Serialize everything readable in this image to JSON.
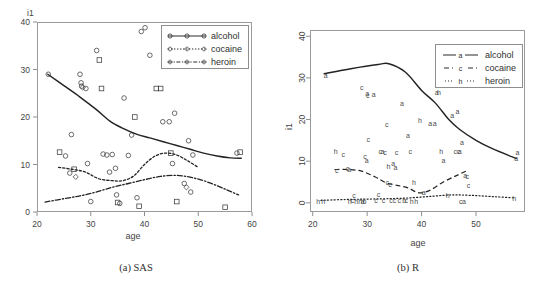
{
  "figure": {
    "panels": [
      {
        "id": "sas",
        "caption": "(a) SAS",
        "ylabel": "i1",
        "xlabel": "age"
      },
      {
        "id": "r",
        "caption": "(b) R",
        "ylabel": "i1",
        "xlabel": "age"
      }
    ]
  },
  "legend": {
    "alcohol": "alcohol",
    "cocaine": "cocaine",
    "heroin": "heroin"
  },
  "ticks": {
    "sas_y": [
      "40",
      "30",
      "20",
      "10",
      "0"
    ],
    "sas_x": [
      "20",
      "30",
      "40",
      "50",
      "60"
    ],
    "r_y": [
      "40",
      "30",
      "20",
      "10",
      "0"
    ],
    "r_x": [
      "20",
      "30",
      "40",
      "50"
    ]
  },
  "chart_data": [
    {
      "type": "scatter",
      "panel": "(a) SAS",
      "title": "",
      "xlabel": "age",
      "ylabel": "i1",
      "xlim": [
        20,
        60
      ],
      "ylim": [
        0,
        40
      ],
      "grid": false,
      "legend_position": "top-right",
      "legend_entries": [
        "alcohol",
        "cocaine",
        "heroin"
      ],
      "marker_styles": [
        "open-circle",
        "open-square",
        "open-diamond"
      ],
      "series": [
        {
          "name": "alcohol",
          "line_style": "solid",
          "x": [
            22.0,
            25.0,
            28.0,
            31.0,
            33.5,
            36.0,
            38.5,
            41.0,
            43.5,
            46.0,
            48.5,
            51.0,
            53.5,
            56.0,
            58.0
          ],
          "values": [
            29.0,
            26.6,
            24.2,
            21.6,
            19.2,
            17.6,
            16.4,
            15.6,
            14.8,
            14.0,
            13.2,
            12.4,
            11.8,
            11.4,
            11.3
          ]
        },
        {
          "name": "cocaine",
          "line_style": "dotted",
          "x": [
            24.0,
            26.5,
            29.0,
            31.5,
            34.0,
            36.0,
            38.0,
            40.0,
            42.0,
            44.0,
            46.0,
            48.0,
            50.0
          ],
          "values": [
            9.4,
            9.0,
            8.4,
            7.0,
            6.6,
            6.6,
            7.6,
            10.0,
            11.8,
            12.4,
            12.0,
            10.8,
            9.4
          ]
        },
        {
          "name": "heroin",
          "line_style": "dash-dot",
          "x": [
            21.5,
            25.0,
            28.0,
            31.0,
            34.0,
            37.0,
            40.0,
            43.0,
            46.0,
            49.0,
            52.0,
            55.0,
            57.5
          ],
          "values": [
            2.1,
            2.8,
            3.4,
            4.2,
            5.2,
            6.0,
            6.8,
            7.5,
            7.7,
            7.2,
            6.2,
            4.8,
            3.6
          ]
        }
      ],
      "points": [
        {
          "x": 22.1,
          "y": 29.0,
          "m": "circle"
        },
        {
          "x": 24.2,
          "y": 12.6,
          "m": "square"
        },
        {
          "x": 25.3,
          "y": 11.8,
          "m": "circle"
        },
        {
          "x": 26.1,
          "y": 8.2,
          "m": "circle"
        },
        {
          "x": 26.4,
          "y": 16.3,
          "m": "circle"
        },
        {
          "x": 26.9,
          "y": 9.0,
          "m": "square"
        },
        {
          "x": 27.2,
          "y": 7.4,
          "m": "diamond"
        },
        {
          "x": 28.0,
          "y": 29.0,
          "m": "circle"
        },
        {
          "x": 28.2,
          "y": 27.2,
          "m": "circle"
        },
        {
          "x": 28.3,
          "y": 26.5,
          "m": "circle"
        },
        {
          "x": 28.5,
          "y": 26.2,
          "m": "diamond"
        },
        {
          "x": 29.1,
          "y": 26.0,
          "m": "circle"
        },
        {
          "x": 29.4,
          "y": 10.2,
          "m": "circle"
        },
        {
          "x": 30.0,
          "y": 2.2,
          "m": "circle"
        },
        {
          "x": 31.1,
          "y": 34.0,
          "m": "circle"
        },
        {
          "x": 31.6,
          "y": 32.0,
          "m": "square"
        },
        {
          "x": 32.0,
          "y": 26.0,
          "m": "square"
        },
        {
          "x": 32.3,
          "y": 12.2,
          "m": "circle"
        },
        {
          "x": 33.0,
          "y": 12.0,
          "m": "circle"
        },
        {
          "x": 33.5,
          "y": 8.4,
          "m": "circle"
        },
        {
          "x": 34.0,
          "y": 12.1,
          "m": "circle"
        },
        {
          "x": 34.6,
          "y": 9.2,
          "m": "circle"
        },
        {
          "x": 34.8,
          "y": 3.6,
          "m": "circle"
        },
        {
          "x": 35.0,
          "y": 2.0,
          "m": "square"
        },
        {
          "x": 35.4,
          "y": 1.8,
          "m": "circle"
        },
        {
          "x": 36.2,
          "y": 24.0,
          "m": "circle"
        },
        {
          "x": 37.0,
          "y": 11.9,
          "m": "circle"
        },
        {
          "x": 37.6,
          "y": 16.2,
          "m": "circle"
        },
        {
          "x": 38.2,
          "y": 20.0,
          "m": "square"
        },
        {
          "x": 38.6,
          "y": 3.0,
          "m": "circle"
        },
        {
          "x": 39.0,
          "y": 1.2,
          "m": "square"
        },
        {
          "x": 39.4,
          "y": 38.0,
          "m": "circle"
        },
        {
          "x": 40.1,
          "y": 38.8,
          "m": "circle"
        },
        {
          "x": 41.0,
          "y": 33.0,
          "m": "circle"
        },
        {
          "x": 42.2,
          "y": 26.0,
          "m": "square"
        },
        {
          "x": 43.0,
          "y": 26.0,
          "m": "square"
        },
        {
          "x": 43.4,
          "y": 19.0,
          "m": "circle"
        },
        {
          "x": 44.6,
          "y": 19.0,
          "m": "circle"
        },
        {
          "x": 44.9,
          "y": 12.4,
          "m": "square"
        },
        {
          "x": 45.2,
          "y": 10.2,
          "m": "circle"
        },
        {
          "x": 45.6,
          "y": 20.8,
          "m": "circle"
        },
        {
          "x": 46.0,
          "y": 2.2,
          "m": "square"
        },
        {
          "x": 47.4,
          "y": 6.0,
          "m": "circle"
        },
        {
          "x": 47.8,
          "y": 5.2,
          "m": "diamond"
        },
        {
          "x": 48.2,
          "y": 15.0,
          "m": "circle"
        },
        {
          "x": 48.6,
          "y": 4.2,
          "m": "circle"
        },
        {
          "x": 49.0,
          "y": 12.0,
          "m": "circle"
        },
        {
          "x": 55.0,
          "y": 1.0,
          "m": "square"
        },
        {
          "x": 57.2,
          "y": 12.4,
          "m": "circle"
        },
        {
          "x": 57.8,
          "y": 12.6,
          "m": "square"
        }
      ]
    },
    {
      "type": "scatter",
      "panel": "(b) R",
      "title": "",
      "xlabel": "age",
      "ylabel": "i1",
      "xlim": [
        20,
        58
      ],
      "ylim": [
        0,
        40
      ],
      "grid": false,
      "legend_position": "top-right",
      "legend_entries": [
        "alcohol",
        "cocaine",
        "heroin"
      ],
      "marker_styles": [
        "a",
        "c",
        "h"
      ],
      "series": [
        {
          "name": "alcohol",
          "line_style": "solid",
          "x": [
            22.0,
            27.0,
            32.0,
            34.0,
            37.0,
            40.0,
            42.5,
            45.0,
            47.0,
            50.0,
            53.0,
            57.5
          ],
          "values": [
            31.0,
            32.2,
            33.2,
            33.4,
            31.4,
            27.0,
            24.0,
            20.0,
            17.6,
            15.0,
            13.0,
            10.6
          ]
        },
        {
          "name": "cocaine",
          "line_style": "dashed",
          "x": [
            24.0,
            26.5,
            29.0,
            31.5,
            33.5,
            35.5,
            37.5,
            39.5,
            41.5,
            44.0,
            46.5,
            48.5
          ],
          "values": [
            8.0,
            8.0,
            7.6,
            6.2,
            4.8,
            4.2,
            3.6,
            2.4,
            3.0,
            5.0,
            6.6,
            7.8
          ]
        },
        {
          "name": "heroin",
          "line_style": "dotted",
          "x": [
            21.5,
            26.0,
            30.0,
            34.0,
            38.0,
            42.0,
            45.5,
            49.0,
            53.0,
            57.0
          ],
          "values": [
            0.6,
            0.8,
            0.9,
            1.0,
            1.2,
            1.6,
            1.9,
            1.8,
            1.5,
            1.2
          ]
        }
      ],
      "points": [
        {
          "x": 22.4,
          "y": 30.6,
          "m": "a"
        },
        {
          "x": 21.0,
          "y": 0.4,
          "m": "h"
        },
        {
          "x": 21.9,
          "y": 0.4,
          "m": "h"
        },
        {
          "x": 24.2,
          "y": 12.4,
          "m": "h"
        },
        {
          "x": 24.4,
          "y": 8.0,
          "m": "c"
        },
        {
          "x": 25.6,
          "y": 11.8,
          "m": "c"
        },
        {
          "x": 26.4,
          "y": 8.3,
          "m": "c"
        },
        {
          "x": 26.7,
          "y": 8.1,
          "m": "a"
        },
        {
          "x": 26.8,
          "y": 0.5,
          "m": "h"
        },
        {
          "x": 27.3,
          "y": 0.6,
          "m": "c"
        },
        {
          "x": 27.6,
          "y": 2.0,
          "m": "c"
        },
        {
          "x": 28.0,
          "y": 0.5,
          "m": "h"
        },
        {
          "x": 28.7,
          "y": 0.5,
          "m": "h"
        },
        {
          "x": 29.0,
          "y": 27.8,
          "m": "c"
        },
        {
          "x": 29.2,
          "y": 0.5,
          "m": "a"
        },
        {
          "x": 29.5,
          "y": 0.5,
          "m": "b"
        },
        {
          "x": 29.6,
          "y": 11.2,
          "m": "c"
        },
        {
          "x": 29.9,
          "y": 10.4,
          "m": "a"
        },
        {
          "x": 30.0,
          "y": 26.4,
          "m": "a"
        },
        {
          "x": 30.1,
          "y": 26.0,
          "m": "c"
        },
        {
          "x": 30.2,
          "y": 15.4,
          "m": "c"
        },
        {
          "x": 31.2,
          "y": 26.2,
          "m": "a"
        },
        {
          "x": 31.6,
          "y": 0.6,
          "m": "c"
        },
        {
          "x": 32.1,
          "y": 2.2,
          "m": "c"
        },
        {
          "x": 32.4,
          "y": 12.4,
          "m": "c"
        },
        {
          "x": 32.8,
          "y": 12.4,
          "m": "a"
        },
        {
          "x": 33.0,
          "y": 0.6,
          "m": "c"
        },
        {
          "x": 33.3,
          "y": 12.3,
          "m": "c"
        },
        {
          "x": 33.6,
          "y": 19.0,
          "m": "c"
        },
        {
          "x": 33.7,
          "y": 5.0,
          "m": "c"
        },
        {
          "x": 33.9,
          "y": 8.8,
          "m": "h"
        },
        {
          "x": 34.2,
          "y": 4.6,
          "m": "c"
        },
        {
          "x": 34.4,
          "y": 0.6,
          "m": "c"
        },
        {
          "x": 34.8,
          "y": 9.6,
          "m": "a"
        },
        {
          "x": 35.0,
          "y": 0.6,
          "m": "c"
        },
        {
          "x": 35.2,
          "y": 8.6,
          "m": "a"
        },
        {
          "x": 35.4,
          "y": 12.3,
          "m": "c"
        },
        {
          "x": 35.9,
          "y": 0.6,
          "m": "c"
        },
        {
          "x": 36.4,
          "y": 24.0,
          "m": "a"
        },
        {
          "x": 36.8,
          "y": 0.6,
          "m": "b"
        },
        {
          "x": 37.2,
          "y": 0.6,
          "m": "c"
        },
        {
          "x": 37.5,
          "y": 16.4,
          "m": "a"
        },
        {
          "x": 37.9,
          "y": 12.4,
          "m": "c"
        },
        {
          "x": 38.2,
          "y": 0.5,
          "m": "h"
        },
        {
          "x": 38.6,
          "y": 5.0,
          "m": "h"
        },
        {
          "x": 39.0,
          "y": 0.5,
          "m": "h"
        },
        {
          "x": 39.7,
          "y": 20.0,
          "m": "h"
        },
        {
          "x": 40.4,
          "y": 2.6,
          "m": "a"
        },
        {
          "x": 41.6,
          "y": 19.2,
          "m": "a"
        },
        {
          "x": 42.4,
          "y": 19.2,
          "m": "a"
        },
        {
          "x": 42.8,
          "y": 26.6,
          "m": "a"
        },
        {
          "x": 43.2,
          "y": 26.6,
          "m": "h"
        },
        {
          "x": 43.6,
          "y": 12.4,
          "m": "h"
        },
        {
          "x": 44.0,
          "y": 10.2,
          "m": "a"
        },
        {
          "x": 44.8,
          "y": 1.8,
          "m": "h"
        },
        {
          "x": 45.6,
          "y": 21.0,
          "m": "a"
        },
        {
          "x": 46.2,
          "y": 12.4,
          "m": "c"
        },
        {
          "x": 46.8,
          "y": 12.4,
          "m": "c"
        },
        {
          "x": 47.0,
          "y": 12.4,
          "m": "a"
        },
        {
          "x": 47.2,
          "y": 0.5,
          "m": "c"
        },
        {
          "x": 47.4,
          "y": 14.6,
          "m": "a"
        },
        {
          "x": 47.8,
          "y": 0.5,
          "m": "a"
        },
        {
          "x": 48.0,
          "y": 6.6,
          "m": "a"
        },
        {
          "x": 48.4,
          "y": 6.4,
          "m": "c"
        },
        {
          "x": 48.6,
          "y": 4.4,
          "m": "c"
        },
        {
          "x": 46.6,
          "y": 22.0,
          "m": "a"
        },
        {
          "x": 57.0,
          "y": 1.2,
          "m": "h"
        },
        {
          "x": 57.6,
          "y": 12.2,
          "m": "a"
        },
        {
          "x": 57.4,
          "y": 10.8,
          "m": "a"
        }
      ]
    }
  ]
}
